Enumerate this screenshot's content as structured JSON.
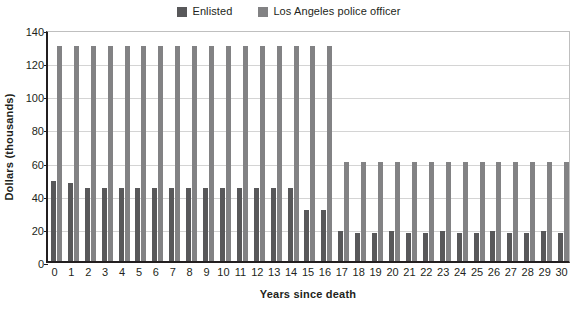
{
  "legend": {
    "items": [
      {
        "label": "Enlisted",
        "color": "#58585a",
        "key": "enlisted"
      },
      {
        "label": "Los Angeles police officer",
        "color": "#828284",
        "key": "lapd"
      }
    ]
  },
  "axes": {
    "ylabel": "Dollars (thousands)",
    "xlabel": "Years since death"
  },
  "chart_data": {
    "type": "bar",
    "title": "",
    "xlabel": "Years since death",
    "ylabel": "Dollars (thousands)",
    "ylim": [
      0,
      140
    ],
    "yticks": [
      0,
      20,
      40,
      60,
      80,
      100,
      120,
      140
    ],
    "ytick_labels": [
      "0",
      "20",
      "40",
      "60",
      "80",
      "100",
      "120",
      "140"
    ],
    "grid": true,
    "legend_position": "top-center",
    "categories": [
      "0",
      "1",
      "2",
      "3",
      "4",
      "5",
      "6",
      "7",
      "8",
      "9",
      "10",
      "11",
      "12",
      "13",
      "14",
      "15",
      "16",
      "17",
      "18",
      "19",
      "20",
      "21",
      "22",
      "23",
      "24",
      "25",
      "26",
      "27",
      "28",
      "29",
      "30"
    ],
    "series": [
      {
        "name": "Enlisted",
        "color": "#58585a",
        "values": [
          48,
          47,
          44,
          44,
          44,
          44,
          44,
          44,
          44,
          44,
          44,
          44,
          44,
          44,
          44,
          31,
          31,
          18,
          17,
          17,
          18,
          17,
          17,
          18,
          17,
          17,
          18,
          17,
          17,
          18,
          17
        ]
      },
      {
        "name": "Los Angeles police officer",
        "color": "#828284",
        "values": [
          130,
          130,
          130,
          130,
          130,
          130,
          130,
          130,
          130,
          130,
          130,
          130,
          130,
          130,
          130,
          130,
          130,
          60,
          60,
          60,
          60,
          60,
          60,
          60,
          60,
          60,
          60,
          60,
          60,
          60,
          60
        ]
      }
    ]
  }
}
